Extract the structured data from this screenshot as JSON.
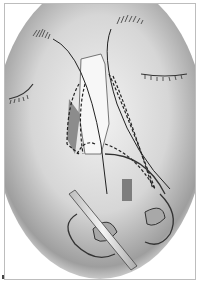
{
  "figure": {
    "colors": {
      "face_shadow": "#9a9a9a",
      "skin_light": "#ececec",
      "line": "#2a2a2a",
      "graft_dark": "#8a8a8a",
      "instrument": "#d8d8d8",
      "frame_border": "#bdbdbd"
    }
  }
}
